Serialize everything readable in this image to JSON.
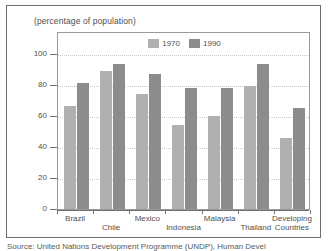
{
  "chart_data": {
    "type": "bar",
    "title": "(percentage of population)",
    "xlabel": "",
    "ylabel": "",
    "ylim": [
      0,
      110
    ],
    "yticks": [
      0,
      20,
      40,
      60,
      80,
      100
    ],
    "grid": true,
    "legend_position": "top-center",
    "categories": [
      "Brazil",
      "Chile",
      "Mexico",
      "Indonesia",
      "Malaysia",
      "Thailand",
      "Developing Countries"
    ],
    "series": [
      {
        "name": "1970",
        "color": "#b0b0b0",
        "values": [
          66,
          89,
          74,
          54,
          60,
          79,
          46
        ]
      },
      {
        "name": "1990",
        "color": "#8c8c8c",
        "values": [
          81,
          93,
          87,
          78,
          78,
          93,
          65
        ]
      }
    ]
  },
  "figure": {
    "title": "(percentage of population)",
    "source_note": "Source: United Nations Development Programme (UNDP), Human Devel"
  },
  "legend": {
    "entries": [
      {
        "label": "1970"
      },
      {
        "label": "1990"
      }
    ]
  },
  "axis": {
    "y_tick_labels": [
      "100",
      "80",
      "60",
      "40",
      "20",
      "0"
    ]
  },
  "colors": {
    "series_1970": "#b0b0b0",
    "series_1990": "#8c8c8c",
    "frame": "#6e6e6e",
    "plot_border": "#9a9a9a",
    "gridline": "#c9c9c9",
    "text": "#4f4f4f",
    "background": "#ffffff"
  }
}
